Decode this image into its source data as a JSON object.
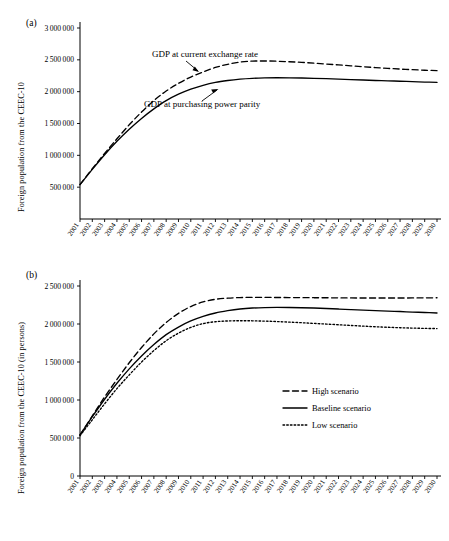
{
  "figure": {
    "cut_title": "- - - - - -",
    "panels": [
      {
        "label": "(a)",
        "ylabel": "Foreign population from the CEEC-10",
        "yticks": [
          "3 000 000",
          "2 500 000",
          "2 000 000",
          "1 500 000",
          "1 000 000",
          "500 000"
        ],
        "annotations": [
          {
            "text": "GDP at current exchange rate"
          },
          {
            "text": "GDP at purchasing power parity"
          }
        ]
      },
      {
        "label": "(b)",
        "ylabel": "Foreign population from the CEEC-10 (in persons)",
        "yticks": [
          "2 500 000",
          "2 000 000",
          "1 500 000",
          "1 000 000",
          "500 000",
          "0"
        ],
        "legend": [
          {
            "label": "High scenario",
            "style": "dashed"
          },
          {
            "label": "Baseline scenario",
            "style": "solid"
          },
          {
            "label": "Low scenario",
            "style": "dotted"
          }
        ]
      }
    ],
    "xticks": [
      "2001",
      "2002",
      "2003",
      "2004",
      "2005",
      "2006",
      "2007",
      "2008",
      "2009",
      "2010",
      "2011",
      "2012",
      "2013",
      "2014",
      "2015",
      "2016",
      "2017",
      "2018",
      "2019",
      "2020",
      "2021",
      "2022",
      "2023",
      "2024",
      "2025",
      "2026",
      "2027",
      "2028",
      "2029",
      "2030"
    ]
  },
  "chart_data": [
    {
      "type": "line",
      "title": "(a)",
      "xlabel": "",
      "ylabel": "Foreign population from the CEEC-10",
      "x": [
        2001,
        2002,
        2003,
        2004,
        2005,
        2006,
        2007,
        2008,
        2009,
        2010,
        2011,
        2012,
        2013,
        2014,
        2015,
        2016,
        2017,
        2018,
        2019,
        2020,
        2021,
        2022,
        2023,
        2024,
        2025,
        2026,
        2027,
        2028,
        2029,
        2030
      ],
      "xlim": [
        2001,
        2030
      ],
      "ylim": [
        0,
        3000000
      ],
      "ytick_values": [
        500000,
        1000000,
        1500000,
        2000000,
        2500000,
        3000000
      ],
      "grid": false,
      "legend_position": "none",
      "series": [
        {
          "name": "GDP at current exchange rate",
          "style": "dashed",
          "values": [
            540000,
            790000,
            1030000,
            1260000,
            1480000,
            1680000,
            1860000,
            2010000,
            2130000,
            2230000,
            2310000,
            2380000,
            2430000,
            2465000,
            2480000,
            2482000,
            2478000,
            2470000,
            2460000,
            2448000,
            2434000,
            2420000,
            2406000,
            2392000,
            2378000,
            2366000,
            2355000,
            2345000,
            2337000,
            2330000
          ]
        },
        {
          "name": "GDP at purchasing power parity",
          "style": "solid",
          "values": [
            540000,
            780000,
            1010000,
            1220000,
            1410000,
            1580000,
            1730000,
            1860000,
            1960000,
            2040000,
            2100000,
            2145000,
            2175000,
            2197000,
            2210000,
            2216000,
            2218000,
            2217000,
            2214000,
            2210000,
            2204000,
            2197000,
            2190000,
            2183000,
            2176000,
            2170000,
            2164000,
            2157000,
            2151000,
            2145000
          ]
        }
      ]
    },
    {
      "type": "line",
      "title": "(b)",
      "xlabel": "",
      "ylabel": "Foreign population from the CEEC-10 (in persons)",
      "x": [
        2001,
        2002,
        2003,
        2004,
        2005,
        2006,
        2007,
        2008,
        2009,
        2010,
        2011,
        2012,
        2013,
        2014,
        2015,
        2016,
        2017,
        2018,
        2019,
        2020,
        2021,
        2022,
        2023,
        2024,
        2025,
        2026,
        2027,
        2028,
        2029,
        2030
      ],
      "xlim": [
        2001,
        2030
      ],
      "ylim": [
        0,
        2500000
      ],
      "ytick_values": [
        0,
        500000,
        1000000,
        1500000,
        2000000,
        2500000
      ],
      "grid": false,
      "legend_position": "center-right",
      "series": [
        {
          "name": "High scenario",
          "style": "dashed",
          "values": [
            540000,
            790000,
            1040000,
            1270000,
            1490000,
            1690000,
            1870000,
            2020000,
            2140000,
            2230000,
            2290000,
            2325000,
            2340000,
            2348000,
            2350000,
            2350000,
            2349000,
            2348000,
            2347000,
            2346000,
            2345000,
            2344000,
            2343000,
            2342000,
            2342000,
            2342000,
            2342000,
            2343000,
            2344000,
            2345000
          ]
        },
        {
          "name": "Baseline scenario",
          "style": "solid",
          "values": [
            540000,
            780000,
            1010000,
            1220000,
            1410000,
            1580000,
            1730000,
            1860000,
            1960000,
            2040000,
            2100000,
            2145000,
            2175000,
            2197000,
            2210000,
            2216000,
            2218000,
            2217000,
            2214000,
            2210000,
            2204000,
            2197000,
            2190000,
            2183000,
            2176000,
            2170000,
            2164000,
            2157000,
            2151000,
            2145000
          ]
        },
        {
          "name": "Low scenario",
          "style": "dotted",
          "values": [
            530000,
            740000,
            950000,
            1150000,
            1330000,
            1500000,
            1650000,
            1780000,
            1880000,
            1955000,
            2005000,
            2030000,
            2040000,
            2043000,
            2042000,
            2038000,
            2032000,
            2025000,
            2017000,
            2008000,
            1999000,
            1990000,
            1981000,
            1972000,
            1964000,
            1957000,
            1951000,
            1946000,
            1942000,
            1940000
          ]
        }
      ]
    }
  ]
}
